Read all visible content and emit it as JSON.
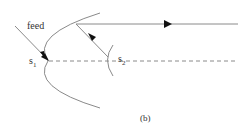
{
  "diagram": {
    "labels": {
      "feed": "feed",
      "s1_main": "s",
      "s1_sub": "1",
      "s2_main": "s",
      "s2_sub": "2",
      "caption": "(b)"
    },
    "colors": {
      "line": "#8a8a8a",
      "arrow": "#111111",
      "text": "#333333"
    },
    "elements": [
      "feed-ray",
      "parabolic-reflector",
      "subreflector-arc",
      "reflected-ray",
      "output-ray",
      "axis-dashed-line"
    ]
  }
}
